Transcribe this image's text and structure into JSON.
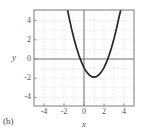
{
  "figure": {
    "panel_label": "(b)",
    "x_axis_label": "x",
    "y_axis_label": "y",
    "x_tick_labels": [
      "-4",
      "-2",
      "0",
      "2",
      "4"
    ],
    "y_tick_labels": [
      "4",
      "2",
      "0",
      "-2",
      "-4"
    ],
    "curve_color": "#262626",
    "axis_color": "#6e6e6e",
    "grid_color": "#b9b9b9",
    "frame_color": "#7a7a7a",
    "text_color": "#555555"
  },
  "chart_data": {
    "type": "line",
    "title": "",
    "subtitle": "",
    "xlabel": "x",
    "ylabel": "y",
    "xlim": [
      -5,
      5
    ],
    "ylim": [
      -5,
      5
    ],
    "grid": true,
    "legend": "none",
    "annotations": [
      "(b)"
    ],
    "xticks": [
      -4,
      -2,
      0,
      2,
      4
    ],
    "yticks": [
      -4,
      -2,
      0,
      2,
      4
    ],
    "series": [
      {
        "name": "parabola",
        "equation": "y = x^2 - 2x - 1",
        "vertex": [
          1,
          -2
        ],
        "x": [
          -1.7,
          -1.5,
          -1.25,
          -1.0,
          -0.75,
          -0.5,
          -0.25,
          0,
          0.25,
          0.5,
          0.75,
          1.0,
          1.25,
          1.5,
          1.75,
          2.0,
          2.25,
          2.5,
          2.75,
          3.0,
          3.25,
          3.5,
          3.7
        ],
        "values": [
          5.29,
          4.25,
          3.06,
          2.0,
          1.06,
          0.25,
          -0.44,
          -1.0,
          -1.44,
          -1.75,
          -1.94,
          -2.0,
          -1.94,
          -1.75,
          -1.44,
          -1.0,
          -0.44,
          0.25,
          1.06,
          2.0,
          3.06,
          4.25,
          5.09
        ]
      }
    ]
  }
}
